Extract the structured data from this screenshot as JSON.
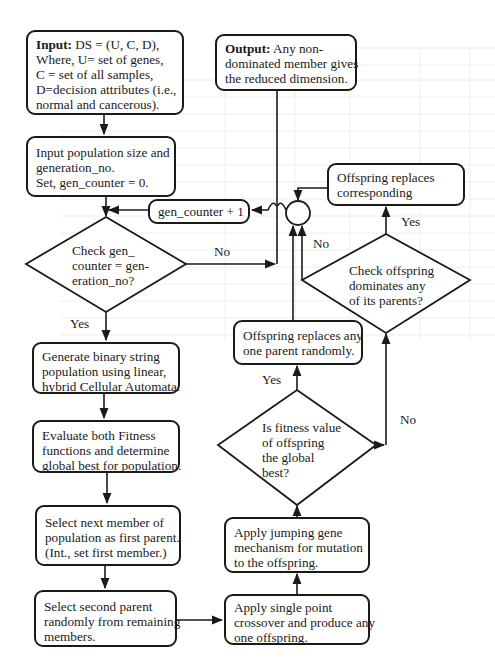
{
  "diagram": {
    "title": "",
    "nodes": {
      "input": {
        "label_bold": "Input:",
        "lines": [
          "DS = (U, C, D),",
          "Where, U= set of genes,",
          "C = set of all samples,",
          "D=decision attributes (i.e.,",
          "normal and cancerous)."
        ]
      },
      "output": {
        "label_bold": "Output:",
        "lines": [
          "Any non-",
          "dominated member gives",
          "the reduced dimension."
        ]
      },
      "init": {
        "lines": [
          "Input population size and",
          "generation_no.",
          "Set, gen_counter = 0."
        ]
      },
      "increment": {
        "lines": [
          "gen_counter + 1"
        ]
      },
      "check_gen": {
        "lines": [
          "Check gen_",
          "counter = gen-",
          "eration_no?"
        ]
      },
      "generate": {
        "lines": [
          "Generate binary string",
          "population using linear,",
          "hybrid Cellular Automata."
        ]
      },
      "evaluate": {
        "lines": [
          "Evaluate both Fitness",
          "functions and determine",
          "global best for population."
        ]
      },
      "select_first": {
        "lines": [
          "Select next member of",
          "population as first parent.",
          "(Int., set first member.)"
        ]
      },
      "select_second": {
        "lines": [
          "Select second parent",
          "randomly from remaining",
          "members."
        ]
      },
      "crossover": {
        "lines": [
          "Apply single point",
          "crossover and produce any",
          "one offspring."
        ]
      },
      "mutation": {
        "lines": [
          "Apply jumping gene",
          "mechanism for mutation",
          "to the offspring."
        ]
      },
      "check_fitness": {
        "lines": [
          "Is fitness value",
          "of offspring",
          "the global",
          "best?"
        ]
      },
      "replace_random": {
        "lines": [
          "Offspring replaces any",
          "one parent randomly."
        ]
      },
      "check_dominates": {
        "lines": [
          "Check offspring",
          "dominates any",
          "of its parents?"
        ]
      },
      "replace_corresponding": {
        "lines": [
          "Offspring replaces",
          "corresponding"
        ]
      }
    },
    "edge_labels": {
      "check_gen_no": "No",
      "check_gen_yes": "Yes",
      "fitness_yes": "Yes",
      "fitness_no": "No",
      "dominates_yes": "Yes",
      "dominates_no": "No"
    },
    "colors": {
      "stroke": "#1a1a1a",
      "background": "#ffffff",
      "ghost": "#ececec"
    }
  }
}
